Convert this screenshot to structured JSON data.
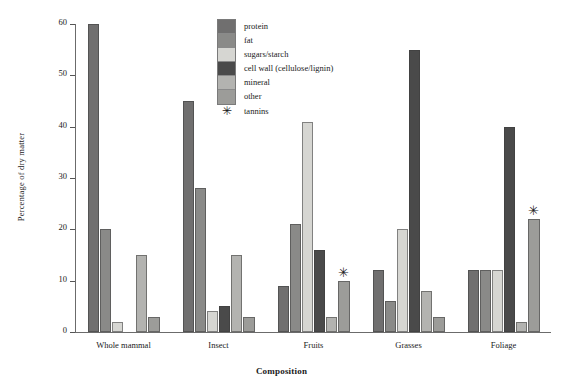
{
  "chart_data": {
    "type": "bar",
    "title": "",
    "xlabel": "Composition",
    "ylabel": "Percentage of dry matter",
    "ylim": [
      0,
      60
    ],
    "yticks": [
      0,
      10,
      20,
      30,
      40,
      50,
      60
    ],
    "grid": false,
    "legend_position": "top-center",
    "categories": [
      "Whole mammal",
      "Insect",
      "Fruits",
      "Grasses",
      "Foliage"
    ],
    "series": [
      {
        "name": "protein",
        "color": "#706f6f",
        "values": [
          60,
          45,
          9,
          12,
          12
        ]
      },
      {
        "name": "fat",
        "color": "#8a8a88",
        "values": [
          20,
          28,
          21,
          6,
          12
        ]
      },
      {
        "name": "sugars/starch",
        "color": "#d6d6d2",
        "values": [
          2,
          4,
          41,
          20,
          12
        ]
      },
      {
        "name": "cell wall (cellulose/lignin)",
        "color": "#4a4a4a",
        "values": [
          0,
          5,
          16,
          55,
          40
        ]
      },
      {
        "name": "mineral",
        "color": "#b3b3b0",
        "values": [
          15,
          15,
          3,
          8,
          2
        ]
      },
      {
        "name": "other",
        "color": "#9c9c99",
        "values": [
          3,
          3,
          10,
          3,
          22
        ]
      }
    ],
    "annotations": [
      {
        "symbol": "✳",
        "label": "tannins",
        "category": "Fruits",
        "series": "other",
        "value": 10
      },
      {
        "symbol": "✳",
        "label": "tannins",
        "category": "Foliage",
        "series": "other",
        "value": 22
      }
    ],
    "legend_entries": [
      {
        "label": "protein"
      },
      {
        "label": "fat"
      },
      {
        "label": "sugars/starch"
      },
      {
        "label": "cell wall (cellulose/lignin)"
      },
      {
        "label": "mineral"
      },
      {
        "label": "other"
      }
    ],
    "legend_tannins": {
      "symbol": "✳",
      "label": "tannins"
    }
  }
}
